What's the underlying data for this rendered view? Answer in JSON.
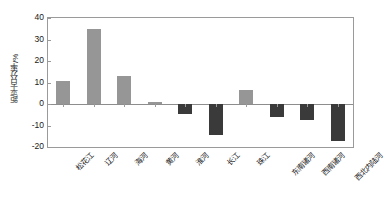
{
  "chart_data": {
    "type": "bar",
    "title": "",
    "subtitle": "",
    "xlabel": "",
    "ylabel": "距平百分率/%",
    "categories": [
      "松花江",
      "辽河",
      "海河",
      "黄河",
      "淮河",
      "长江",
      "珠江",
      "东南诸河",
      "西南诸河",
      "西北内陆河"
    ],
    "values": [
      10.5,
      35.0,
      13.0,
      0.8,
      -4.5,
      -14.5,
      6.5,
      -6.0,
      -7.5,
      -17.0
    ],
    "ylim": [
      -20,
      40
    ],
    "yticks": [
      40,
      30,
      20,
      10,
      0,
      -10,
      -20
    ],
    "ytick_labels": [
      "40",
      "30",
      "20",
      "10",
      "0",
      "-10",
      "-20"
    ],
    "grid": false,
    "legend": "none",
    "bar_color_positive": "#969696",
    "bar_color_negative": "#3a3a3a",
    "axis_color": "#9a9a9a",
    "background_color": "#ffffff"
  }
}
